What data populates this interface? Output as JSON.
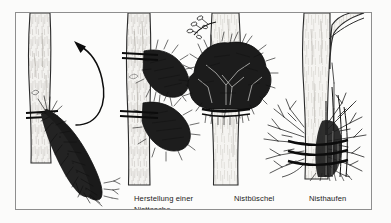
{
  "figure": {
    "kind": "line-drawing-illustration",
    "language": "de",
    "background_color": "#fbfbfa",
    "ink_color": "#111111",
    "frame_color": "#8e8e8e",
    "trunk_fill": "#f2f1ee",
    "trunk_shade": "#d8d6d1"
  },
  "labels": [
    {
      "id": "nisttasche",
      "line1": "Herstellung einer",
      "line2": "Nisttasche"
    },
    {
      "id": "nistbuschel",
      "line1": "Nistbüschel",
      "line2": ""
    },
    {
      "id": "nisthaufen",
      "line1": "Nisthaufen",
      "line2": ""
    }
  ],
  "panels": [
    {
      "id": "panel-1",
      "name": "herstellung-einer-nisttasche",
      "label": "Herstellung einer Nisttasche",
      "trunk": "vertical",
      "bindings": 2,
      "bundle": "hanging-brush-pocket-drooping-down-right",
      "arrow": {
        "shape": "curved",
        "direction": "up-left",
        "bow": "right"
      }
    },
    {
      "id": "panel-2",
      "name": "nisttasche-two-bundles",
      "label": "",
      "trunk": "vertical",
      "bindings": 4,
      "bundle": "two-brush-bundles-stacked-upper-and-lower"
    },
    {
      "id": "panel-3",
      "name": "nistbuschel",
      "label": "Nistbüschel",
      "trunk": "vertical-wide",
      "bindings": 1,
      "bundle": "dense-leafy-bush-mass-around-trunk",
      "extra": "small-leafy-branch-upper-left"
    },
    {
      "id": "panel-4",
      "name": "nisthaufen",
      "label": "Nisthaufen",
      "trunk": "vertical-with-fork",
      "bindings": 3,
      "bundle": "twiggy-brush-pile-around-trunk-base",
      "extra": "branch-fork-upper-right"
    }
  ],
  "icons": {
    "arrow": "curved-arrow-icon",
    "trunk": "tree-trunk-icon",
    "brush": "brushwood-bundle-icon",
    "binding": "binding-cord-icon",
    "leaf_branch": "leafy-branch-icon"
  }
}
